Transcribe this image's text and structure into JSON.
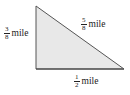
{
  "figure": {
    "type": "right-triangle",
    "fill_color": "#e8e8e8",
    "stroke_color": "#444444",
    "vertices": {
      "top": [
        36,
        6
      ],
      "right_angle": [
        36,
        69
      ],
      "right": [
        124,
        69
      ]
    }
  },
  "labels": {
    "left_side": {
      "numerator": "3",
      "denominator": "8",
      "unit": "mile"
    },
    "hypotenuse": {
      "numerator": "5",
      "denominator": "8",
      "unit": "mile"
    },
    "bottom_side": {
      "numerator": "1",
      "denominator": "2",
      "unit": "mile"
    }
  }
}
